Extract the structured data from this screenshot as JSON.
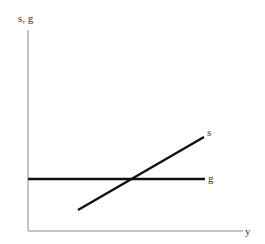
{
  "diagram": {
    "y_axis_label": "s, g",
    "x_axis_label": "y",
    "series": [
      {
        "name": "s",
        "label": "s",
        "type": "upward-sloping line"
      },
      {
        "name": "g",
        "label": "g",
        "type": "horizontal line"
      }
    ],
    "colors": {
      "axes": "#888888",
      "lines": "#111111",
      "text": "#333333"
    }
  }
}
